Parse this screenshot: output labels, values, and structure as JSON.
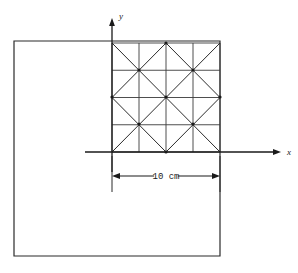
{
  "figure": {
    "type": "engineering-diagram",
    "background_color": "#ffffff",
    "line_color": "#2b2b2b"
  },
  "axes": {
    "y_label": "y",
    "x_label": "x",
    "origin": {
      "x": 112,
      "y": 152
    },
    "x_axis": {
      "start_x": 85,
      "end_x": 281,
      "y": 152,
      "arrow": true
    },
    "y_axis": {
      "x": 112,
      "start_y": 172,
      "end_y": 18,
      "arrow": true
    }
  },
  "plate": {
    "name": "outer-square-plate",
    "left": 14,
    "top": 41,
    "right": 220,
    "bottom": 256,
    "width": 206,
    "height": 215
  },
  "mesh": {
    "name": "triangular-element-mesh",
    "left": 112,
    "top": 43,
    "right": 220,
    "bottom": 152,
    "divisions": 4,
    "cell_size": 27,
    "diagonal_pattern": [
      [
        "nwse",
        "nesw",
        "nwse",
        "nesw"
      ],
      [
        "nesw",
        "nwse",
        "nesw",
        "nwse"
      ],
      [
        "nwse",
        "nesw",
        "nwse",
        "nesw"
      ],
      [
        "nesw",
        "nwse",
        "nesw",
        "nwse"
      ]
    ],
    "node_markers": [
      [
        139,
        70
      ],
      [
        193,
        70
      ],
      [
        166,
        97
      ],
      [
        139,
        124
      ],
      [
        193,
        124
      ],
      [
        166,
        43
      ],
      [
        112,
        97
      ],
      [
        220,
        97
      ],
      [
        166,
        152
      ]
    ]
  },
  "dimension": {
    "name": "width-dimension",
    "label": "10 cm",
    "value": 10,
    "unit": "cm",
    "y": 176,
    "start_x": 112,
    "end_x": 220,
    "extension_left_bottom": 192,
    "extension_right_bottom": 192
  }
}
